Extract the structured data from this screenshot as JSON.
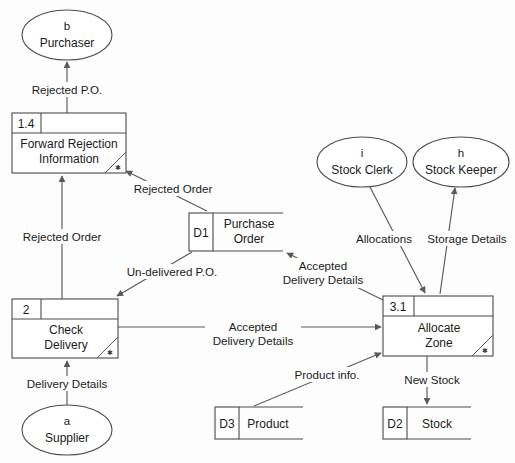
{
  "diagram": {
    "type": "data-flow-diagram",
    "notation": "Yourdon/DeMarco",
    "background_color": "#fdfdfd",
    "line_color": "#4a4a4a",
    "text_color": "#1b1b1b"
  },
  "external_entities": [
    {
      "id": "b",
      "name": "Purchaser",
      "shape": "ellipse",
      "cx": 67,
      "cy": 35,
      "rx": 45,
      "ry": 25
    },
    {
      "id": "a",
      "name": "Supplier",
      "shape": "ellipse",
      "cx": 67,
      "cy": 430,
      "rx": 45,
      "ry": 25
    },
    {
      "id": "i",
      "name": "Stock Clerk",
      "shape": "ellipse",
      "cx": 362,
      "cy": 162,
      "rx": 45,
      "ry": 25
    },
    {
      "id": "h",
      "name": "Stock Keeper",
      "shape": "ellipse",
      "cx": 461,
      "cy": 162,
      "rx": 48,
      "ry": 25
    }
  ],
  "processes": [
    {
      "number": "1.4",
      "name_line1": "Forward Rejection",
      "name_line2": "Information",
      "x": 12,
      "y": 113,
      "w": 114,
      "h": 60
    },
    {
      "number": "2",
      "name_line1": "Check",
      "name_line2": "Delivery",
      "x": 12,
      "y": 299,
      "w": 106,
      "h": 59
    },
    {
      "number": "3.1",
      "name_line1": "Allocate",
      "name_line2": "Zone",
      "x": 383,
      "y": 296,
      "w": 110,
      "h": 60
    }
  ],
  "data_stores": [
    {
      "id": "D1",
      "name_line1": "Purchase",
      "name_line2": "Order",
      "x": 189,
      "y": 213,
      "w": 94,
      "h": 38
    },
    {
      "id": "D3",
      "name_line1": "Product",
      "name_line2": "",
      "x": 215,
      "y": 407,
      "w": 88,
      "h": 32
    },
    {
      "id": "D2",
      "name_line1": "Stock",
      "name_line2": "",
      "x": 383,
      "y": 407,
      "w": 88,
      "h": 32
    }
  ],
  "data_flows": [
    {
      "label_line1": "Rejected P.O.",
      "label_line2": "",
      "from": "1.4",
      "to": "b",
      "label_x": 67,
      "label_y": 92
    },
    {
      "label_line1": "Rejected Order",
      "label_line2": "",
      "from": "D1",
      "to": "1.4",
      "label_x": 172,
      "label_y": 191
    },
    {
      "label_line1": "Rejected Order",
      "label_line2": "",
      "from": "2",
      "to": "1.4",
      "label_x": 62,
      "label_y": 240
    },
    {
      "label_line1": "Un-delivered P.O.",
      "label_line2": "",
      "from": "2",
      "to": "D1",
      "label_x": 172,
      "label_y": 274
    },
    {
      "label_line1": "Accepted",
      "label_line2": "Delivery Details",
      "from": "3.1",
      "to": "D1",
      "label_x": 323,
      "label_y": 272
    },
    {
      "label_line1": "Accepted",
      "label_line2": "Delivery Details",
      "from": "2",
      "to": "3.1",
      "label_x": 253,
      "label_y": 328
    },
    {
      "label_line1": "Delivery Details",
      "label_line2": "",
      "from": "a",
      "to": "2",
      "label_x": 67,
      "label_y": 386
    },
    {
      "label_line1": "Allocations",
      "label_line2": "",
      "from": "i",
      "to": "3.1",
      "label_x": 383,
      "label_y": 241
    },
    {
      "label_line1": "Storage Details",
      "label_line2": "",
      "from": "3.1",
      "to": "h",
      "label_x": 465,
      "label_y": 241
    },
    {
      "label_line1": "Product info.",
      "label_line2": "",
      "from": "D3",
      "to": "3.1",
      "label_x": 327,
      "label_y": 377
    },
    {
      "label_line1": "New Stock",
      "label_line2": "",
      "from": "3.1",
      "to": "D2",
      "label_x": 430,
      "label_y": 382
    }
  ]
}
